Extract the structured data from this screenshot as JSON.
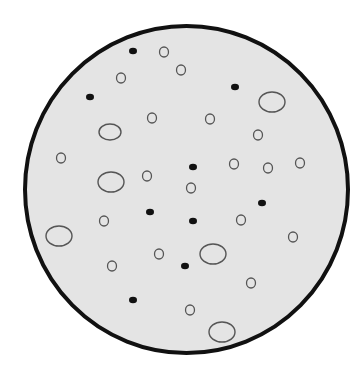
{
  "colors": {
    "background": "#ffffff",
    "dish_fill": "#e4e4e4",
    "dish_stroke": "#111111",
    "open_stroke": "#555555",
    "filled": "#111111"
  },
  "dish": {
    "cx": 186.5,
    "cy": 189.5,
    "rx": 161.5,
    "ry": 163.5,
    "stroke_width": 4
  },
  "filled_dots": [
    {
      "x": 133,
      "y": 51
    },
    {
      "x": 90,
      "y": 97
    },
    {
      "x": 235,
      "y": 87
    },
    {
      "x": 193,
      "y": 167
    },
    {
      "x": 150,
      "y": 212
    },
    {
      "x": 193,
      "y": 221
    },
    {
      "x": 262,
      "y": 203
    },
    {
      "x": 185,
      "y": 266
    },
    {
      "x": 133,
      "y": 300
    }
  ],
  "small_circles": [
    {
      "x": 164,
      "y": 52
    },
    {
      "x": 121,
      "y": 78
    },
    {
      "x": 181,
      "y": 70
    },
    {
      "x": 152,
      "y": 118
    },
    {
      "x": 210,
      "y": 119
    },
    {
      "x": 258,
      "y": 135
    },
    {
      "x": 61,
      "y": 158
    },
    {
      "x": 147,
      "y": 176
    },
    {
      "x": 191,
      "y": 188
    },
    {
      "x": 234,
      "y": 164
    },
    {
      "x": 268,
      "y": 168
    },
    {
      "x": 300,
      "y": 163
    },
    {
      "x": 104,
      "y": 221
    },
    {
      "x": 241,
      "y": 220
    },
    {
      "x": 293,
      "y": 237
    },
    {
      "x": 159,
      "y": 254
    },
    {
      "x": 112,
      "y": 266
    },
    {
      "x": 251,
      "y": 283
    },
    {
      "x": 190,
      "y": 310
    }
  ],
  "large_ellipses": [
    {
      "x": 272,
      "y": 102,
      "rx": 13,
      "ry": 10
    },
    {
      "x": 110,
      "y": 132,
      "rx": 11,
      "ry": 8
    },
    {
      "x": 111,
      "y": 182,
      "rx": 13,
      "ry": 10
    },
    {
      "x": 59,
      "y": 236,
      "rx": 13,
      "ry": 10
    },
    {
      "x": 213,
      "y": 254,
      "rx": 13,
      "ry": 10
    },
    {
      "x": 222,
      "y": 332,
      "rx": 13,
      "ry": 10
    }
  ]
}
